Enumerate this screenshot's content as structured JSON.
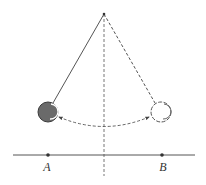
{
  "diagram": {
    "type": "pendulum",
    "labels": {
      "point_a": "A",
      "point_b": "B"
    },
    "colors": {
      "line": "#555555",
      "bob_fill": "#6a6a6a",
      "bob_outline": "#444444",
      "ghost_outline": "#555555",
      "background": "#ffffff"
    },
    "elements": [
      "pivot point",
      "solid string to left bob (position A)",
      "dashed string to right bob (position B)",
      "vertical dashed center line",
      "dashed double-headed arc between bobs",
      "horizontal ground line with points A and B"
    ]
  }
}
